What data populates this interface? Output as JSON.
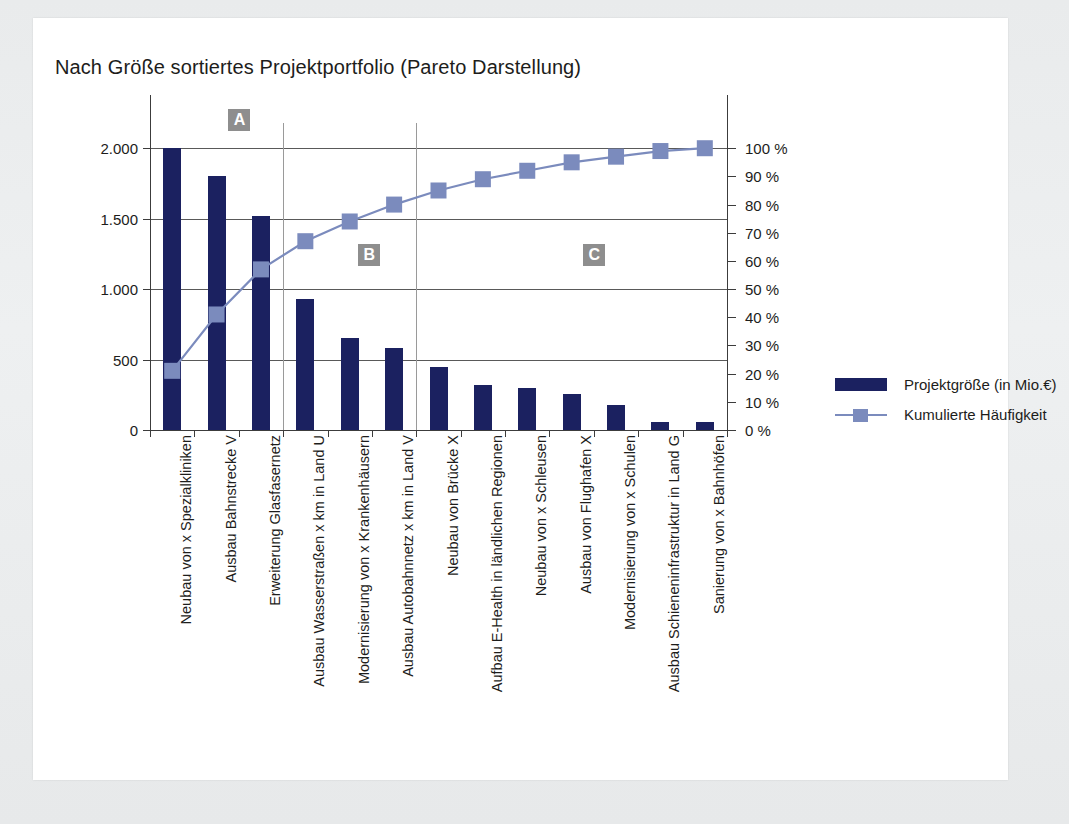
{
  "chart_data": {
    "type": "bar",
    "title": "Nach Größe sortiertes Projektportfolio (Pareto Darstellung)",
    "xlabel": "",
    "ylabel": "",
    "ylabel_right": "",
    "ylim": [
      0,
      2250
    ],
    "ylim_right": [
      0,
      112.5
    ],
    "grid": true,
    "legend_position": "right",
    "categories": [
      "Neubau von x Spezialkliniken",
      "Ausbau Bahnstrecke V",
      "Erweiterung Glasfasernetz",
      "Ausbau Wasserstraßen x km in Land U",
      "Modernisierung von x Krankenhäusern",
      "Ausbau Autobahnnetz x km in Land V",
      "Neubau von Brücke X",
      "Aufbau E-Health in ländlichen Regionen",
      "Neubau von x Schleusen",
      "Ausbau von Flughafen X",
      "Modernisierung von x Schulen",
      "Ausbau Schieneninfrastruktur in Land G",
      "Sanierung von x Bahnhöfen"
    ],
    "series": [
      {
        "name": "Projektgröße (in Mio.€)",
        "type": "bar",
        "axis": "left",
        "color": "#1b2160",
        "values": [
          2000,
          1800,
          1520,
          930,
          650,
          580,
          450,
          320,
          300,
          255,
          180,
          55,
          55
        ]
      },
      {
        "name": "Kumulierte Häufigkeit",
        "type": "line",
        "axis": "right",
        "color": "#7b8bbd",
        "values": [
          21,
          41,
          57,
          67,
          74,
          80,
          85,
          89,
          92,
          95,
          97,
          99,
          100
        ]
      }
    ],
    "yticks_left": [
      "0",
      "500",
      "1.000",
      "1.500",
      "2.000"
    ],
    "ytick_values_left": [
      0,
      500,
      1000,
      1500,
      2000
    ],
    "yticks_right": [
      "0 %",
      "10 %",
      "20 %",
      "30 %",
      "40 %",
      "50 %",
      "60 %",
      "70 %",
      "80 %",
      "90 %",
      "100 %"
    ],
    "ytick_values_right": [
      0,
      10,
      20,
      30,
      40,
      50,
      60,
      70,
      80,
      90,
      100
    ],
    "annotations": [
      {
        "label": "A",
        "x_pct": 15.5,
        "y_value": 2200
      },
      {
        "label": "B",
        "x_pct": 38.0,
        "y_value": 1240
      },
      {
        "label": "C",
        "x_pct": 77.0,
        "y_value": 1240
      }
    ],
    "segment_dividers": [
      3,
      6
    ]
  },
  "legend": {
    "items": [
      {
        "label": "Projektgröße (in Mio.€)",
        "marker": "bar-swatch",
        "color": "#1b2160"
      },
      {
        "label": "Kumulierte Häufigkeit",
        "marker": "line-square-swatch",
        "color": "#7b8bbd"
      }
    ]
  }
}
